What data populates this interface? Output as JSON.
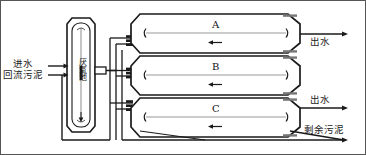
{
  "figure": {
    "title": "",
    "type": "process-flow-diagram",
    "domain": "wastewater-treatment"
  },
  "labels": {
    "influent": "进水",
    "return_sludge": "回流污泥",
    "anaerobic_tank": "厌氧池",
    "effluent_top": "出水",
    "effluent_bottom": "出水",
    "excess_sludge": "剩余污泥"
  },
  "reactors": [
    {
      "id": "A",
      "label": "A"
    },
    {
      "id": "B",
      "label": "B"
    },
    {
      "id": "C",
      "label": "C"
    }
  ],
  "colors": {
    "line": "#1a1a1a",
    "inner_line": "#8a8a8a",
    "fill": "#ffffff",
    "background": "#ffffff",
    "border": "#555555"
  }
}
